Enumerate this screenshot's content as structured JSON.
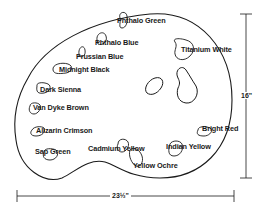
{
  "diagram": {
    "colors": {
      "ink": "#1a1a1a",
      "background": "#ffffff"
    },
    "paints": [
      {
        "id": "phthalo-green",
        "label": "Phthalo Green",
        "x": 118,
        "y": 20
      },
      {
        "id": "phthalo-blue",
        "label": "Phthalo Blue",
        "x": 96,
        "y": 40
      },
      {
        "id": "prussian-blue",
        "label": "Prussian Blue",
        "x": 77,
        "y": 54
      },
      {
        "id": "midnight-black",
        "label": "Midnight Black",
        "x": 60,
        "y": 67
      },
      {
        "id": "titanium-white",
        "label": "Titanium White",
        "x": 181,
        "y": 47
      },
      {
        "id": "dark-sienna",
        "label": "Dark Sienna",
        "x": 36,
        "y": 87
      },
      {
        "id": "van-dyke-brown",
        "label": "Van Dyke Brown",
        "x": 34,
        "y": 104
      },
      {
        "id": "alizarin-crimson",
        "label": "Alizarin Crimson",
        "x": 35,
        "y": 127
      },
      {
        "id": "sap-green",
        "label": "Sap Green",
        "x": 34,
        "y": 149
      },
      {
        "id": "cadmium-yellow",
        "label": "Cadmium Yellow",
        "x": 88,
        "y": 146
      },
      {
        "id": "yellow-ochre",
        "label": "Yellow Ochre",
        "x": 133,
        "y": 163
      },
      {
        "id": "indian-yellow",
        "label": "Indian Yellow",
        "x": 166,
        "y": 144
      },
      {
        "id": "bright-red",
        "label": "Bright Red",
        "x": 202,
        "y": 126
      }
    ],
    "dimensions": {
      "height_label": "16\"",
      "width_label": "23½\""
    },
    "thumb_holes": 2
  }
}
